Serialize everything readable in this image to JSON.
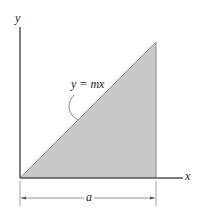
{
  "diagram": {
    "type": "triangular area under line",
    "axes": {
      "y_label": "y",
      "x_label": "x"
    },
    "curve": {
      "equation_label": "y = mx",
      "description": "straight line through origin"
    },
    "region": {
      "shape": "right triangle",
      "fill_color": "#c8c8c8",
      "vertices_px": [
        [
          20,
          178
        ],
        [
          156,
          42
        ],
        [
          156,
          178
        ]
      ]
    },
    "dimension": {
      "label": "a",
      "from": "origin",
      "to": "right edge of triangle"
    },
    "colors": {
      "axis": "#555555",
      "fill": "#c8c8c8",
      "edge": "#777777",
      "text": "#222222",
      "background": "#ffffff"
    }
  }
}
